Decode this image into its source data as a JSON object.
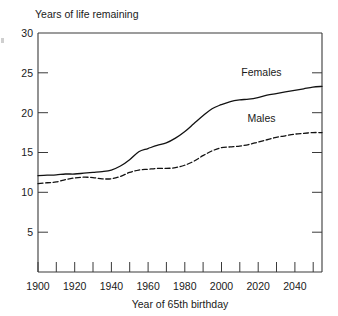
{
  "chart_data": {
    "type": "line",
    "title": "",
    "ylabel": "Years of life remaining",
    "xlabel": "Year of 65th birthday",
    "xlim": [
      1900,
      2055
    ],
    "ylim": [
      0,
      30
    ],
    "grid": false,
    "legend_position": "inline-annotation",
    "y_ticks": [
      5,
      10,
      15,
      20,
      25,
      30
    ],
    "y_tick_labels": [
      "5",
      "10",
      "15",
      "20",
      "25",
      "30"
    ],
    "x_ticks": [
      1900,
      1910,
      1920,
      1930,
      1940,
      1950,
      1960,
      1970,
      1980,
      1990,
      2000,
      2010,
      2020,
      2030,
      2040,
      2050
    ],
    "x_tick_labels_shown": [
      "1900",
      "1920",
      "1940",
      "1960",
      "1980",
      "2000",
      "2020",
      "2040"
    ],
    "x_labeled_ticks": [
      1900,
      1920,
      1940,
      1960,
      1980,
      2000,
      2020,
      2040
    ],
    "x": [
      1900,
      1905,
      1910,
      1915,
      1920,
      1925,
      1930,
      1935,
      1940,
      1945,
      1950,
      1955,
      1960,
      1965,
      1970,
      1975,
      1980,
      1985,
      1990,
      1995,
      2000,
      2005,
      2010,
      2015,
      2020,
      2025,
      2030,
      2035,
      2040,
      2045,
      2050,
      2055
    ],
    "series": [
      {
        "name": "Females",
        "style": "solid",
        "color": "#121212",
        "values": [
          12.1,
          12.15,
          12.2,
          12.3,
          12.3,
          12.4,
          12.5,
          12.6,
          12.8,
          13.3,
          14.1,
          15.1,
          15.5,
          15.9,
          16.2,
          16.8,
          17.6,
          18.6,
          19.6,
          20.5,
          21.0,
          21.4,
          21.6,
          21.7,
          21.9,
          22.2,
          22.4,
          22.6,
          22.8,
          23.0,
          23.2,
          23.3
        ]
      },
      {
        "name": "Males",
        "style": "dashed",
        "color": "#121212",
        "values": [
          11.1,
          11.2,
          11.3,
          11.6,
          11.8,
          11.9,
          11.85,
          11.7,
          11.7,
          12.0,
          12.5,
          12.8,
          12.9,
          13.0,
          13.0,
          13.1,
          13.4,
          13.9,
          14.6,
          15.2,
          15.6,
          15.7,
          15.8,
          16.0,
          16.3,
          16.6,
          16.9,
          17.1,
          17.3,
          17.4,
          17.5,
          17.5
        ]
      }
    ],
    "annotations": [
      {
        "text": "Females",
        "x": 2022,
        "y": 24.6
      },
      {
        "text": "Males",
        "x": 2022,
        "y": 18.8
      }
    ]
  },
  "labels": {
    "y_axis_title": "Years of life remaining",
    "x_axis_title": "Year of 65th birthday",
    "series_females": "Females",
    "series_males": "Males"
  }
}
